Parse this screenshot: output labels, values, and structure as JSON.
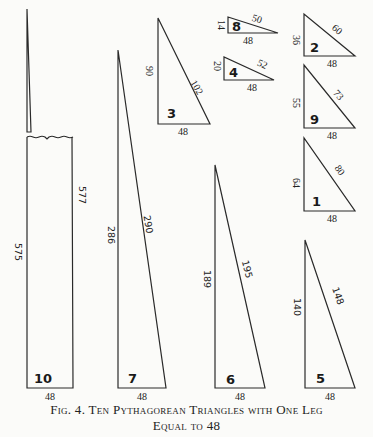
{
  "figure": {
    "caption_line1": "Fig. 4. Ten Pythagorean Triangles with One Leg",
    "caption_line2": "Equal to 48"
  },
  "triangles": [
    {
      "id": "1",
      "leg_a": "48",
      "leg_b": "64",
      "hypotenuse": "80"
    },
    {
      "id": "2",
      "leg_a": "48",
      "leg_b": "36",
      "hypotenuse": "60"
    },
    {
      "id": "3",
      "leg_a": "48",
      "leg_b": "90",
      "hypotenuse": "102"
    },
    {
      "id": "4",
      "leg_a": "48",
      "leg_b": "20",
      "hypotenuse": "52"
    },
    {
      "id": "5",
      "leg_a": "48",
      "leg_b": "140",
      "hypotenuse": "148"
    },
    {
      "id": "6",
      "leg_a": "48",
      "leg_b": "189",
      "hypotenuse": "195"
    },
    {
      "id": "7",
      "leg_a": "48",
      "leg_b": "286",
      "hypotenuse": "290"
    },
    {
      "id": "8",
      "leg_a": "48",
      "leg_b": "14",
      "hypotenuse": "50"
    },
    {
      "id": "9",
      "leg_a": "48",
      "leg_b": "55",
      "hypotenuse": "73"
    },
    {
      "id": "10",
      "leg_a": "48",
      "leg_b": "575",
      "hypotenuse": "577"
    }
  ]
}
